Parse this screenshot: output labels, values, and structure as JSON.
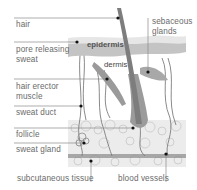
{
  "labels_left": [
    {
      "id": "hair",
      "text": "hair"
    },
    {
      "id": "pore",
      "text": "pore releasing\nsweat"
    },
    {
      "id": "erector",
      "text": "hair erector\nmuscle"
    },
    {
      "id": "duct",
      "text": "sweat duct"
    },
    {
      "id": "follicle",
      "text": "follicle"
    },
    {
      "id": "gland",
      "text": "sweat gland"
    }
  ],
  "labels_right": [
    {
      "id": "sebaceous",
      "text": "sebaceous\nglands"
    }
  ],
  "labels_bottom": [
    {
      "id": "subcutaneous",
      "text": "subcutaneous tissue"
    },
    {
      "id": "vessels",
      "text": "blood vessels"
    }
  ],
  "labels_inner": [
    {
      "id": "epidermis",
      "text": "epidermis"
    },
    {
      "id": "dermis",
      "text": "dermis"
    }
  ],
  "colors": {
    "label_text": "#6a6a6a",
    "leader_line": "#8a8a8a",
    "epidermis": "#c9c9c9",
    "epidermis_top": "#e4e4e4",
    "hair_shaft": "#8f8f8f",
    "subcutaneous": "#e6e6e6",
    "dot": "#111111"
  }
}
